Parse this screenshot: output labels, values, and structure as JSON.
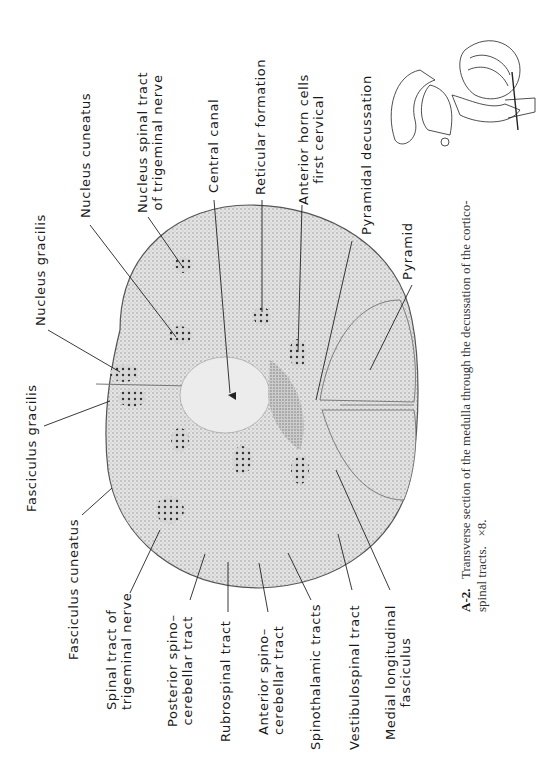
{
  "figure": {
    "id": "A-2.",
    "caption": "Transverse section of the medulla through the decussation of the cortico-",
    "caption_line2": "spinal tracts.",
    "magnification": "×8.",
    "orientation": "rotated 90° counter-clockwise"
  },
  "labels": {
    "nucleus_gracilis": "Nucleus  gracilis",
    "nucleus_cuneatus": "Nucleus  cuneatus",
    "nucleus_spinal_tract_l1": "Nucleus  spinal  tract",
    "nucleus_spinal_tract_l2": "of  trigeminal  nerve",
    "central_canal": "Central  canal",
    "reticular_formation": "Reticular  formation",
    "anterior_horn_l1": "Anterior  horn  cells",
    "anterior_horn_l2": "first  cervical",
    "pyramidal_decussation": "Pyramidal  decussation",
    "pyramid": "Pyramid",
    "fasciculus_gracilis": "Fasciculus  gracilis",
    "fasciculus_cuneatus": "Fasciculus  cuneatus",
    "spinal_tract_trig_l1": "Spinal  tract  of",
    "spinal_tract_trig_l2": "trigeminal  nerve",
    "posterior_spinocerebellar_l1": "Posterior  spino–",
    "posterior_spinocerebellar_l2": "cerebellar  tract",
    "rubrospinal": "Rubrospinal  tract",
    "anterior_spinocerebellar_l1": "Anterior  spino–",
    "anterior_spinocerebellar_l2": "cerebellar  tract",
    "spinothalamic": "Spinothalamic  tracts",
    "vestibulospinal": "Vestibulospinal  tract",
    "mlf_l1": "Medial  longitudinal",
    "mlf_l2": "fasciculus"
  },
  "colors": {
    "ink": "#1a1a1a",
    "tissue_light": "#d9d9d9",
    "tissue_dark": "#8c8c8c",
    "paper": "#ffffff"
  }
}
